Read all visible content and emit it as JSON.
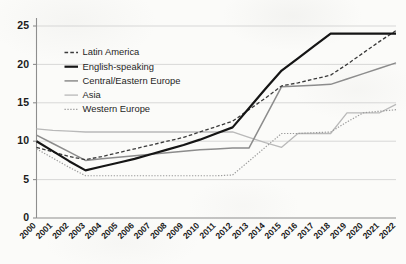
{
  "chart_data": {
    "type": "line",
    "title": "",
    "subtitle": "",
    "xlabel": "",
    "ylabel": "",
    "xlim": [
      2000,
      2022
    ],
    "ylim": [
      0,
      25
    ],
    "grid": "horizontal",
    "legend_position": "inside-upper-left",
    "x": [
      2000,
      2001,
      2002,
      2003,
      2004,
      2005,
      2006,
      2007,
      2008,
      2009,
      2010,
      2011,
      2012,
      2013,
      2014,
      2015,
      2016,
      2017,
      2018,
      2019,
      2020,
      2021,
      2022
    ],
    "xtick_labels": [
      "2000",
      "2001",
      "2002",
      "2003",
      "2004",
      "2005",
      "2006",
      "2007",
      "2008",
      "2009",
      "2010",
      "2011",
      "2012",
      "2013",
      "2014",
      "2015",
      "2016",
      "2017",
      "2018",
      "2019",
      "2020",
      "2021",
      "2022"
    ],
    "ytick_labels": [
      "0",
      "5",
      "10",
      "15",
      "20",
      "25"
    ],
    "yticks": [
      0,
      5,
      10,
      15,
      20,
      25
    ],
    "series": [
      {
        "name": "Latin America",
        "style": "dashed",
        "color": "#3a3a3a",
        "width": 1.3,
        "dash": "3.6,2.2",
        "values": [
          9.2,
          8.6,
          8.0,
          7.6,
          8.0,
          8.5,
          9.0,
          9.5,
          10.0,
          10.5,
          11.2,
          11.9,
          12.6,
          14.1,
          15.6,
          17.2,
          17.6,
          18.1,
          18.6,
          20.0,
          21.5,
          23.0,
          24.4
        ]
      },
      {
        "name": "English-speaking",
        "style": "solid",
        "color": "#151515",
        "width": 2.2,
        "dash": "",
        "values": [
          10.0,
          8.7,
          7.4,
          6.2,
          6.7,
          7.2,
          7.7,
          8.3,
          8.9,
          9.5,
          10.2,
          11.0,
          11.8,
          14.3,
          16.8,
          19.2,
          20.8,
          22.4,
          24.0,
          24.0,
          24.0,
          24.0,
          24.0
        ]
      },
      {
        "name": "Central/Eastern Europe",
        "style": "solid",
        "color": "#8c8c8c",
        "width": 1.5,
        "dash": "",
        "values": [
          10.8,
          9.7,
          8.6,
          7.5,
          7.7,
          7.9,
          8.1,
          8.3,
          8.5,
          8.7,
          8.9,
          9.0,
          9.1,
          9.1,
          13.1,
          17.1,
          17.2,
          17.3,
          17.4,
          18.1,
          18.8,
          19.5,
          20.2
        ]
      },
      {
        "name": "Asia",
        "style": "solid",
        "color": "#b9b9b9",
        "width": 1.3,
        "dash": "",
        "values": [
          11.6,
          11.4,
          11.3,
          11.2,
          11.2,
          11.2,
          11.2,
          11.2,
          11.2,
          11.2,
          11.2,
          11.2,
          11.2,
          10.5,
          9.8,
          9.2,
          11.0,
          11.0,
          11.0,
          13.7,
          13.7,
          13.7,
          14.8
        ]
      },
      {
        "name": "Western Europe",
        "style": "dotted",
        "color": "#9a9a9a",
        "width": 1.2,
        "dash": "1.3,1.6",
        "values": [
          9.0,
          7.8,
          6.6,
          5.5,
          5.5,
          5.5,
          5.5,
          5.5,
          5.5,
          5.5,
          5.5,
          5.5,
          5.6,
          7.4,
          9.2,
          11.0,
          11.0,
          11.1,
          11.2,
          12.5,
          13.7,
          13.9,
          14.1
        ]
      }
    ]
  },
  "legend": {
    "entries": [
      {
        "label": "Latin America"
      },
      {
        "label": "English-speaking"
      },
      {
        "label": "Central/Eastern Europe"
      },
      {
        "label": "Asia"
      },
      {
        "label": "Western Europe"
      }
    ]
  }
}
